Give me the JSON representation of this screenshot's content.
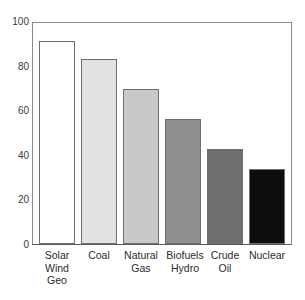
{
  "chart_data": {
    "type": "bar",
    "title": "",
    "subtitle": "",
    "xlabel": "",
    "ylabel": "",
    "ylim": [
      0,
      100
    ],
    "yticks": [
      0,
      20,
      40,
      60,
      80,
      100
    ],
    "grid": false,
    "legend": false,
    "categories": [
      "Solar Wind Geo",
      "Coal",
      "Natural Gas",
      "Biofuels Hydro",
      "Crude Oil",
      "Nuclear"
    ],
    "category_lines": [
      [
        "Solar",
        "Wind",
        "Geo"
      ],
      [
        "Coal"
      ],
      [
        "Natural",
        "Gas"
      ],
      [
        "Biofuels",
        "Hydro"
      ],
      [
        "Crude",
        "Oil"
      ],
      [
        "Nuclear"
      ]
    ],
    "values": [
      92,
      83.5,
      70,
      56.5,
      43,
      34
    ],
    "bar_colors": [
      "#ffffff",
      "#e2e2e2",
      "#c9c9c9",
      "#8f8f8f",
      "#6e6e6e",
      "#0d0d0d"
    ],
    "bar_edge_color": "#6f6f6f"
  },
  "axis": {
    "frame_color": "#8a8a8a",
    "tick_label_color": "#3a3a3a"
  }
}
